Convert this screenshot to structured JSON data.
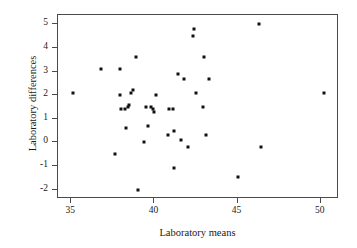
{
  "chart_data": {
    "type": "scatter",
    "title": "",
    "xlabel": "Laboratory means",
    "ylabel": "Laboratory differences",
    "xlim": [
      34.2,
      51.1
    ],
    "ylim": [
      -2.4,
      5.4
    ],
    "xticks": [
      35,
      40,
      45,
      50
    ],
    "yticks": [
      -2,
      -1,
      0,
      1,
      2,
      3,
      4,
      5
    ],
    "xticklabels": [
      "35",
      "40",
      "45",
      "50"
    ],
    "yticklabels": [
      "-2",
      "-1",
      "0",
      "1",
      "2",
      "3",
      "4",
      "5"
    ],
    "grid": false,
    "legend": null,
    "marker": "square",
    "marker_color": "#111111",
    "marker_size_px": 3,
    "frame": "box",
    "n_points": 46,
    "points": [
      {
        "x": 35.1,
        "y": 2.1
      },
      {
        "x": 36.8,
        "y": 3.1
      },
      {
        "x": 37.6,
        "y": -0.5
      },
      {
        "x": 37.9,
        "y": 3.1
      },
      {
        "x": 37.9,
        "y": 2.0
      },
      {
        "x": 38.0,
        "y": 1.4
      },
      {
        "x": 38.2,
        "y": 1.4
      },
      {
        "x": 38.3,
        "y": 0.6
      },
      {
        "x": 38.4,
        "y": 1.5
      },
      {
        "x": 38.5,
        "y": 1.6
      },
      {
        "x": 38.6,
        "y": 2.1
      },
      {
        "x": 38.7,
        "y": 2.2
      },
      {
        "x": 38.9,
        "y": 3.6
      },
      {
        "x": 39.0,
        "y": -2.0
      },
      {
        "x": 39.4,
        "y": 0.0
      },
      {
        "x": 39.5,
        "y": 1.5
      },
      {
        "x": 39.6,
        "y": 0.7
      },
      {
        "x": 39.8,
        "y": 1.5
      },
      {
        "x": 39.9,
        "y": 1.4
      },
      {
        "x": 40.0,
        "y": 1.3
      },
      {
        "x": 40.1,
        "y": 2.0
      },
      {
        "x": 40.8,
        "y": 0.3
      },
      {
        "x": 40.9,
        "y": 1.4
      },
      {
        "x": 41.1,
        "y": 1.4
      },
      {
        "x": 41.2,
        "y": 0.5
      },
      {
        "x": 41.2,
        "y": -1.1
      },
      {
        "x": 41.4,
        "y": 2.9
      },
      {
        "x": 41.6,
        "y": 0.1
      },
      {
        "x": 41.8,
        "y": 2.7
      },
      {
        "x": 42.0,
        "y": -0.2
      },
      {
        "x": 42.3,
        "y": 4.5
      },
      {
        "x": 42.4,
        "y": 4.8
      },
      {
        "x": 42.5,
        "y": 2.1
      },
      {
        "x": 42.9,
        "y": 1.5
      },
      {
        "x": 43.0,
        "y": 3.6
      },
      {
        "x": 43.1,
        "y": 0.3
      },
      {
        "x": 43.3,
        "y": 2.7
      },
      {
        "x": 45.0,
        "y": -1.45
      },
      {
        "x": 46.3,
        "y": 5.0
      },
      {
        "x": 46.4,
        "y": -0.2
      },
      {
        "x": 50.2,
        "y": 2.1
      }
    ]
  }
}
